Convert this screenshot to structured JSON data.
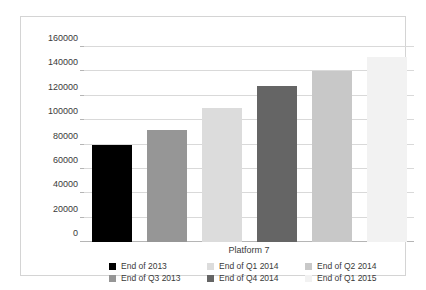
{
  "chart_data": {
    "type": "bar",
    "title": "",
    "xlabel": "Platform 7",
    "ylabel": "",
    "categories": [
      "End of 2013",
      "End of  Q3 2013",
      "End of  Q1 2014",
      "End of  Q4 2014",
      "End of  Q2 2014",
      "End of  Q1 2015"
    ],
    "values": [
      80000,
      92000,
      110000,
      128000,
      140000,
      152000
    ],
    "ylim": [
      0,
      160000
    ],
    "ytick_labels": [
      "0",
      "20000",
      "40000",
      "60000",
      "80000",
      "100000",
      "120000",
      "140000",
      "160000"
    ],
    "ytick_values": [
      0,
      20000,
      40000,
      60000,
      80000,
      100000,
      120000,
      140000,
      160000
    ],
    "grid": true,
    "legend_position": "bottom",
    "series_colors": [
      "#000000",
      "#969696",
      "#dcdcdc",
      "#656565",
      "#c8c8c8",
      "#f2f2f2"
    ]
  },
  "legend": {
    "entries": [
      {
        "label": "End of 2013",
        "color": "#000000"
      },
      {
        "label": "End of  Q3 2013",
        "color": "#969696"
      },
      {
        "label": "End of  Q1 2014",
        "color": "#dcdcdc"
      },
      {
        "label": "End of  Q4 2014",
        "color": "#656565"
      },
      {
        "label": "End of  Q2 2014",
        "color": "#c8c8c8"
      },
      {
        "label": "End of  Q1 2015",
        "color": "#f2f2f2"
      }
    ]
  },
  "axis": {
    "x_title": "Platform 7"
  },
  "colors": {
    "frame": "#d4d4d4",
    "gridline": "#d9d9d9",
    "axis": "#b5b5b5",
    "text": "#3a3a3a",
    "background": "#ffffff"
  }
}
